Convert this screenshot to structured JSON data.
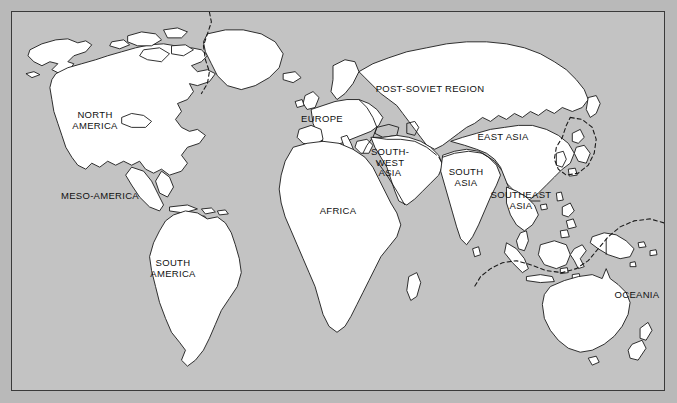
{
  "figure": {
    "background_color": "#b9b9b9",
    "ocean_color": "#c3c3c3",
    "land_color": "#ffffff",
    "outline_color": "#1a1a1a",
    "frame_color": "#3a3a3a"
  },
  "regions": [
    {
      "id": "north-america",
      "label": "NORTH\nAMERICA",
      "x": 95,
      "y": 120
    },
    {
      "id": "meso-america",
      "label": "MESO-AMERICA",
      "x": 100,
      "y": 196
    },
    {
      "id": "south-america",
      "label": "SOUTH\nAMERICA",
      "x": 173,
      "y": 268
    },
    {
      "id": "europe",
      "label": "EUROPE",
      "x": 322,
      "y": 119
    },
    {
      "id": "post-soviet",
      "label": "POST-SOVIET REGION",
      "x": 430,
      "y": 89
    },
    {
      "id": "africa",
      "label": "AFRICA",
      "x": 338,
      "y": 211
    },
    {
      "id": "south-west-asia",
      "label": "SOUTH-\nWEST\nASIA",
      "x": 390,
      "y": 163
    },
    {
      "id": "south-asia",
      "label": "SOUTH\nASIA",
      "x": 466,
      "y": 177
    },
    {
      "id": "east-asia",
      "label": "EAST ASIA",
      "x": 503,
      "y": 137
    },
    {
      "id": "southeast-asia",
      "label": "SOUTHEAST\nASIA",
      "x": 521,
      "y": 200
    },
    {
      "id": "oceania",
      "label": "OCEANIA",
      "x": 637,
      "y": 295
    }
  ]
}
